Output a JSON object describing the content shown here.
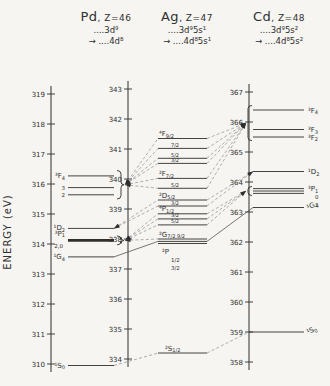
{
  "chart_data": {
    "type": "energy-level-diagram",
    "ylabel": "ENERGY (eV)",
    "unit": "eV",
    "columns": [
      {
        "element": "Pd",
        "z_label": ", Z=46",
        "config_upper": "....3d⁹",
        "config_lower": "→ ....4d⁸",
        "axis": {
          "min": 310,
          "max": 319,
          "tick_step": 1
        },
        "levels": [
          {
            "id": "3F4",
            "E": 316.27,
            "term": "³F",
            "sub": "4"
          },
          {
            "id": "3F3",
            "E": 315.88,
            "term": "3",
            "small": true
          },
          {
            "id": "3F2",
            "E": 315.64,
            "term": "2",
            "small": true
          },
          {
            "id": "1D2",
            "E": 314.52,
            "term": "¹D",
            "sub": "2"
          },
          {
            "id": "3P1",
            "E": 314.12,
            "thick": true
          },
          {
            "id": "1G4",
            "E": 313.57,
            "term": "¹G",
            "sub": "4"
          },
          {
            "id": "1S0",
            "E": 309.95,
            "term": "¹S",
            "sub": "0"
          }
        ],
        "extra_labels": [
          {
            "E": 314.35,
            "term": "³P",
            "sub": "1"
          },
          {
            "E": 313.95,
            "term": "2,0",
            "small": true,
            "dx": -2
          }
        ],
        "brackets": [
          {
            "id": "b3F",
            "E_top": 316.45,
            "E_bottom": 315.5
          },
          {
            "id": "b3P",
            "E_top": 314.27,
            "E_bottom": 313.97
          }
        ]
      },
      {
        "element": "Ag",
        "z_label": ", Z=47",
        "config_upper": "....3d⁹5s¹",
        "config_lower": "→ ....4d⁸5s¹",
        "axis": {
          "min": 334,
          "max": 343,
          "tick_step": 1
        },
        "levels": [
          {
            "id": "4F92",
            "E": 341.35,
            "term": "⁴F",
            "sub": "9/2"
          },
          {
            "id": "4F72",
            "E": 341.02,
            "j": "7/2"
          },
          {
            "id": "4F52",
            "E": 340.69,
            "j": "5/2"
          },
          {
            "id": "4F32",
            "E": 340.52,
            "j": "3/2"
          },
          {
            "id": "2F72",
            "E": 340.02,
            "term": "²F",
            "sub": "7/2"
          },
          {
            "id": "2F52",
            "E": 339.69,
            "j": "5/2"
          },
          {
            "id": "2D52",
            "E": 339.3,
            "term": "²D",
            "sub": "5/2"
          },
          {
            "id": "2D32",
            "E": 339.1,
            "j": "3/2"
          },
          {
            "id": "4P12",
            "E": 338.84,
            "term": "⁴P",
            "sub": "1/2"
          },
          {
            "id": "4P32",
            "E": 338.67,
            "j": "3/2"
          },
          {
            "id": "4P52",
            "E": 338.47,
            "j": "5/2"
          },
          {
            "id": "2Ga",
            "E": 338.0,
            "term": "²G",
            "sub": "7/2,9/2"
          },
          {
            "id": "2Gb",
            "E": 337.92
          },
          {
            "id": "2Gc",
            "E": 337.85
          },
          {
            "id": "2S12",
            "E": 334.2,
            "term": "²S",
            "sub": "1/2",
            "dx": 6
          }
        ],
        "extra_labels": [
          {
            "E": 337.58,
            "term": "²P",
            "dx": 3
          },
          {
            "E": 337.3,
            "term": "1/2",
            "small": true,
            "dx": 12
          },
          {
            "E": 337.02,
            "term": "3/2",
            "small": true,
            "dx": 12
          }
        ],
        "brackets": []
      },
      {
        "element": "Cd",
        "z_label": ", Z=48",
        "config_upper": "....3d⁹5s²",
        "config_lower": "→ ....4d⁸5s²",
        "axis": {
          "min": 358,
          "max": 367,
          "tick_step": 1
        },
        "levels": [
          {
            "id": "3F4",
            "E": 366.4,
            "term": "³F",
            "sub": "4"
          },
          {
            "id": "3F3",
            "E": 365.75,
            "term": "³F",
            "sub": "3"
          },
          {
            "id": "3F2",
            "E": 365.5,
            "term": "³F",
            "sub": "2"
          },
          {
            "id": "1D2",
            "E": 364.35,
            "term": "¹D",
            "sub": "2"
          },
          {
            "id": "3Pa",
            "E": 363.78,
            "term": "³P",
            "sub": "1"
          },
          {
            "id": "3Pb",
            "E": 363.7
          },
          {
            "id": "3Pc",
            "E": 363.62
          },
          {
            "id": "1G4",
            "E": 363.15,
            "term": "¹G",
            "sub": "4",
            "tilt": true
          },
          {
            "id": "1S0",
            "E": 359.0,
            "term": "¹S",
            "sub": "0",
            "tilt": true,
            "x1_off": -4
          }
        ],
        "extra_labels": [
          {
            "E": 363.5,
            "term": "0",
            "small": true,
            "dx": 7
          },
          {
            "E": 363.24,
            "term": "2",
            "small": true,
            "dx": 7
          }
        ],
        "brackets": [
          {
            "id": "b3F",
            "E_top": 366.55,
            "E_bottom": 365.38
          },
          {
            "id": "b3P",
            "E_top": 363.85,
            "E_bottom": 363.55
          }
        ]
      }
    ],
    "connections": [
      {
        "from": "Pd:b3F",
        "to": "Ag:4F92",
        "style": "dashed",
        "arrow": "from"
      },
      {
        "from": "Pd:b3F",
        "to": "Ag:4F72",
        "style": "dashed",
        "arrow": "from"
      },
      {
        "from": "Pd:b3F",
        "to": "Ag:4F52",
        "style": "dashed",
        "arrow": "from"
      },
      {
        "from": "Pd:b3F",
        "to": "Ag:4F32",
        "style": "dashed",
        "arrow": "from"
      },
      {
        "from": "Pd:b3F",
        "to": "Ag:2F72",
        "style": "dashed",
        "arrow": "from"
      },
      {
        "from": "Pd:b3F",
        "to": "Ag:2F52",
        "style": "dashed",
        "arrow": "from"
      },
      {
        "from": "Pd:1D2",
        "to": "Ag:2D52",
        "style": "dashed",
        "arrow": "from"
      },
      {
        "from": "Pd:1D2",
        "to": "Ag:2D32",
        "style": "dashed",
        "arrow": "from"
      },
      {
        "from": "Pd:b3P",
        "to": "Ag:4P12",
        "style": "dashed",
        "arrow": "from"
      },
      {
        "from": "Pd:b3P",
        "to": "Ag:4P32",
        "style": "dashed",
        "arrow": "from"
      },
      {
        "from": "Pd:b3P",
        "to": "Ag:4P52",
        "style": "dashed",
        "arrow": "from"
      },
      {
        "from": "Pd:b3P",
        "to": "Ag:2Ga",
        "style": "dashed",
        "arrow": "from"
      },
      {
        "from": "Pd:1G4",
        "to": "Ag:2Gb",
        "style": "solid"
      },
      {
        "from": "Pd:1S0",
        "to": "Ag:2S12",
        "style": "dashed"
      },
      {
        "from": "Ag:4F92",
        "to": "Cd:b3F",
        "style": "dashed",
        "arrow": "to"
      },
      {
        "from": "Ag:4F72",
        "to": "Cd:b3F",
        "style": "dashed",
        "arrow": "to"
      },
      {
        "from": "Ag:4F52",
        "to": "Cd:b3F",
        "style": "dashed",
        "arrow": "to"
      },
      {
        "from": "Ag:4F32",
        "to": "Cd:b3F",
        "style": "dashed",
        "arrow": "to"
      },
      {
        "from": "Ag:2F72",
        "to": "Cd:b3F",
        "style": "dashed",
        "arrow": "to"
      },
      {
        "from": "Ag:2F52",
        "to": "Cd:b3F",
        "style": "dashed",
        "arrow": "to"
      },
      {
        "from": "Ag:2D52",
        "to": "Cd:1D2",
        "style": "dashed",
        "arrow": "to"
      },
      {
        "from": "Ag:2D32",
        "to": "Cd:1D2",
        "style": "dashed",
        "arrow": "to"
      },
      {
        "from": "Ag:4P12",
        "to": "Cd:b3P",
        "style": "dashed",
        "arrow": "to"
      },
      {
        "from": "Ag:4P32",
        "to": "Cd:b3P",
        "style": "dashed",
        "arrow": "to"
      },
      {
        "from": "Ag:4P52",
        "to": "Cd:b3P",
        "style": "dashed",
        "arrow": "to"
      },
      {
        "from": "Ag:2Gb",
        "to": "Cd:1G4",
        "style": "solid"
      },
      {
        "from": "Ag:2S12",
        "to": "Cd:1S0",
        "style": "dashed"
      }
    ]
  }
}
